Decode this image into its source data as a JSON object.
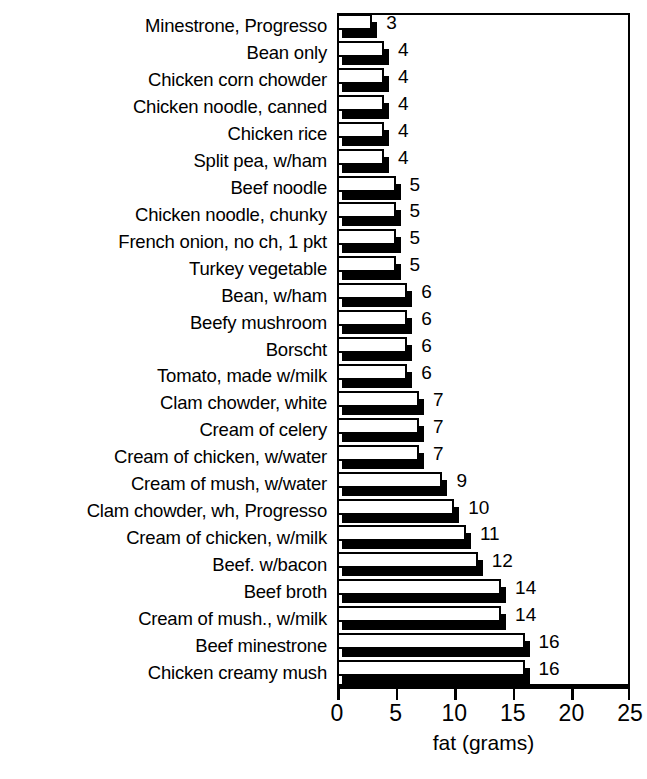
{
  "chart_data": {
    "type": "bar",
    "orientation": "horizontal",
    "title": "",
    "xlabel": "fat (grams)",
    "ylabel": "",
    "xlim": [
      0,
      25
    ],
    "xticks": [
      0,
      5,
      10,
      15,
      20,
      25
    ],
    "xtick_labels": [
      "0",
      "5",
      "10",
      "15",
      "20",
      "25"
    ],
    "grid": false,
    "legend": null,
    "bar_style": "white-fill-black-outline-with-black-drop-shadow",
    "value_labels_shown": true,
    "categories": [
      "Minestrone, Progresso",
      "Bean only",
      "Chicken corn chowder",
      "Chicken noodle, canned",
      "Chicken rice",
      "Split pea, w/ham",
      "Beef noodle",
      "Chicken noodle, chunky",
      "French onion, no ch, 1 pkt",
      "Turkey vegetable",
      "Bean, w/ham",
      "Beefy mushroom",
      "Borscht",
      "Tomato, made w/milk",
      "Clam chowder, white",
      "Cream of celery",
      "Cream of chicken, w/water",
      "Cream of mush, w/water",
      "Clam chowder, wh, Progresso",
      "Cream of chicken, w/milk",
      "Beef. w/bacon",
      "Beef broth",
      "Cream of mush., w/milk",
      "Beef minestrone",
      "Chicken creamy mush"
    ],
    "values": [
      3,
      4,
      4,
      4,
      4,
      4,
      5,
      5,
      5,
      5,
      6,
      6,
      6,
      6,
      7,
      7,
      7,
      9,
      10,
      11,
      12,
      14,
      14,
      16,
      16
    ],
    "value_labels": [
      "3",
      "4",
      "4",
      "4",
      "4",
      "4",
      "5",
      "5",
      "5",
      "5",
      "6",
      "6",
      "6",
      "6",
      "7",
      "7",
      "7",
      "9",
      "10",
      "11",
      "12",
      "14",
      "14",
      "16",
      "16"
    ]
  },
  "colors": {
    "background": "#ffffff",
    "ink": "#000000",
    "bar_fill": "#ffffff",
    "bar_outline": "#000000",
    "bar_shadow": "#000000"
  }
}
